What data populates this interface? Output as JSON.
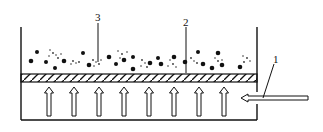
{
  "diagram": {
    "title": "",
    "labels": [
      {
        "id": "1",
        "text": "1",
        "meaning": "air inlet pipe"
      },
      {
        "id": "2",
        "text": "2",
        "meaning": "porous distributor plate"
      },
      {
        "id": "3",
        "text": "3",
        "meaning": "particle bed"
      }
    ],
    "upward_arrow_count": 8,
    "colors": {
      "stroke": "#111111",
      "background": "#ffffff"
    }
  }
}
